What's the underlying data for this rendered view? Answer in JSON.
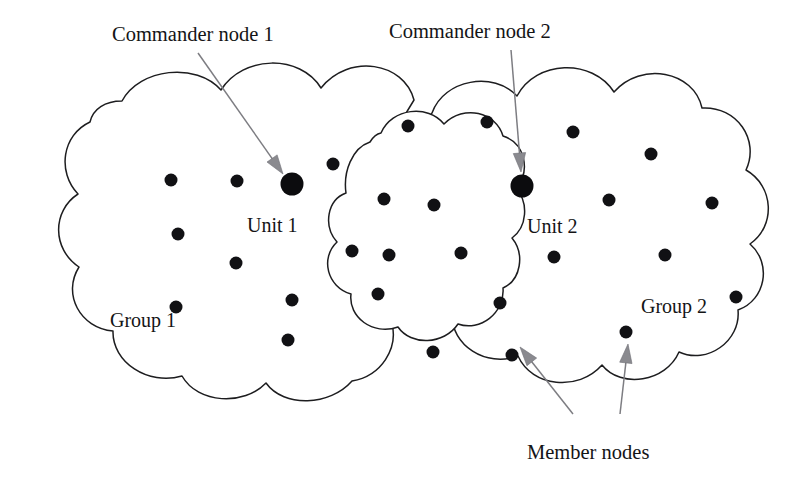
{
  "diagram": {
    "background_color": "#ffffff",
    "outline_color": "#1d1d1f",
    "node_color": "#111114",
    "annotation_color": "#8a8a8f"
  },
  "callouts": {
    "commander_1": "Commander node 1",
    "commander_2": "Commander node 2",
    "member_nodes": "Member nodes"
  },
  "regions": {
    "group_1": "Group 1",
    "group_2": "Group 2"
  },
  "units": {
    "unit_1": "Unit 1",
    "unit_2": "Unit 2"
  },
  "counts": {
    "commander_nodes": 2,
    "member_nodes": 27,
    "groups": 2,
    "units": 2,
    "clouds": 3
  },
  "commander_positions": [
    {
      "name": "commander-node-1",
      "cx": 292,
      "cy": 184,
      "r": 11.5
    },
    {
      "name": "commander-node-2",
      "cx": 522,
      "cy": 186,
      "r": 11.5
    }
  ],
  "member_positions": [
    {
      "cx": 171,
      "cy": 180,
      "r": 6.5
    },
    {
      "cx": 237,
      "cy": 181,
      "r": 6.5
    },
    {
      "cx": 333,
      "cy": 164,
      "r": 6.5
    },
    {
      "cx": 178,
      "cy": 234,
      "r": 6.5
    },
    {
      "cx": 236,
      "cy": 263,
      "r": 6.5
    },
    {
      "cx": 176,
      "cy": 307,
      "r": 6.5
    },
    {
      "cx": 292,
      "cy": 300,
      "r": 6.5
    },
    {
      "cx": 288,
      "cy": 340,
      "r": 6.5
    },
    {
      "cx": 408,
      "cy": 126,
      "r": 6.5
    },
    {
      "cx": 384,
      "cy": 199,
      "r": 6.5
    },
    {
      "cx": 434,
      "cy": 205,
      "r": 6.5
    },
    {
      "cx": 352,
      "cy": 251,
      "r": 6.5
    },
    {
      "cx": 389,
      "cy": 255,
      "r": 6.5
    },
    {
      "cx": 461,
      "cy": 253,
      "r": 6.5
    },
    {
      "cx": 378,
      "cy": 294,
      "r": 6.5
    },
    {
      "cx": 433,
      "cy": 352,
      "r": 6.5
    },
    {
      "cx": 487,
      "cy": 122,
      "r": 6.5
    },
    {
      "cx": 573,
      "cy": 132,
      "r": 6.5
    },
    {
      "cx": 651,
      "cy": 154,
      "r": 6.5
    },
    {
      "cx": 609,
      "cy": 200,
      "r": 6.5
    },
    {
      "cx": 712,
      "cy": 203,
      "r": 6.5
    },
    {
      "cx": 554,
      "cy": 257,
      "r": 6.5
    },
    {
      "cx": 665,
      "cy": 255,
      "r": 6.5
    },
    {
      "cx": 500,
      "cy": 303,
      "r": 6.5
    },
    {
      "cx": 736,
      "cy": 297,
      "r": 6.5
    },
    {
      "cx": 512,
      "cy": 355,
      "r": 6.5
    },
    {
      "cx": 626,
      "cy": 332,
      "r": 6.5
    }
  ],
  "annotations": [
    {
      "name": "commander-1-leader",
      "label": "Commander node 1",
      "from": {
        "x": 198,
        "y": 53
      },
      "to": {
        "x": 283,
        "y": 174
      }
    },
    {
      "name": "commander-2-leader",
      "label": "Commander node 2",
      "from": {
        "x": 511,
        "y": 50
      },
      "to": {
        "x": 521,
        "y": 172
      }
    },
    {
      "name": "member-node-leader-left",
      "label": "Member nodes",
      "from": {
        "x": 573,
        "y": 414
      },
      "to": {
        "x": 520,
        "y": 347
      }
    },
    {
      "name": "member-node-leader-right",
      "label": "Member nodes",
      "from": {
        "x": 620,
        "y": 414
      },
      "to": {
        "x": 628,
        "y": 344
      }
    }
  ],
  "label_positions": {
    "commander_1": {
      "x": 112,
      "y": 41
    },
    "commander_2": {
      "x": 389,
      "y": 38
    },
    "unit_1": {
      "x": 247,
      "y": 232
    },
    "unit_2": {
      "x": 527,
      "y": 233
    },
    "group_1": {
      "x": 110,
      "y": 327
    },
    "group_2": {
      "x": 641,
      "y": 313
    },
    "member_nodes": {
      "x": 527,
      "y": 459
    }
  }
}
